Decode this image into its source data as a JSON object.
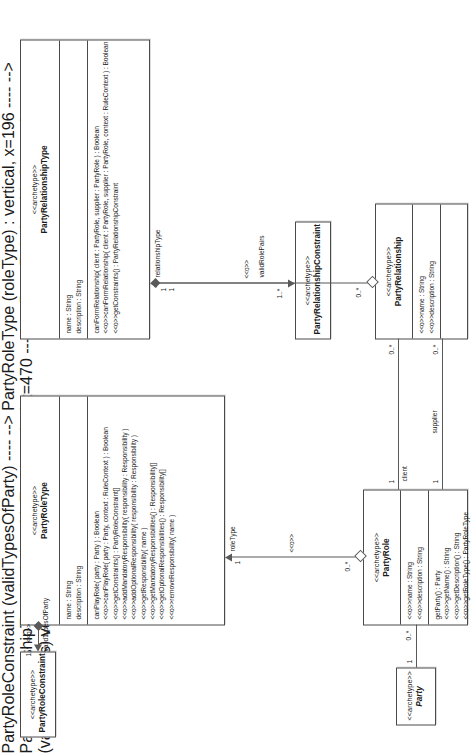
{
  "diagram": {
    "stereotype": "<<archetype>>",
    "op_stereotype": "<<o>>",
    "assoc_stereotype": "<<o>>"
  },
  "classes": {
    "party": {
      "stereotype": "<<archetype>>",
      "name": "Party",
      "attributes": [],
      "operations": []
    },
    "party_role": {
      "stereotype": "<<archetype>>",
      "name": "PartyRole",
      "attributes": [
        "<<o>>name : String",
        "<<o>>description : String"
      ],
      "operations": [
        "getParty() : Party",
        "<<o>>getName() : String",
        "<<o>>getDescription() : String",
        "<<o>>getRoleType() : PartyRoleType"
      ]
    },
    "party_role_type": {
      "stereotype": "<<archetype>>",
      "name": "PartyRoleType",
      "attributes": [
        "name : String",
        "description : String"
      ],
      "operations": [
        "canPlayRole( party : Party ) : Boolean",
        "<<o>>canPlayRole( party : Party, context : RuleContext ) : Boolean",
        "<<o>>getConstraints() : PartyRoleConstraint[]",
        "<<o>>addMandatoryResponsibility( responsibility : Responsibility )",
        "<<o>>addOptionalResponsibility( responsibility : Responsibility )",
        "<<o>>getResponsibility( name )",
        "<<o>>getMandatoryResponsibilities() : Responsibility[]",
        "<<o>>getOptionalResponsibilities() : Responsibility[]",
        "<<o>>removeResponsibility( name )"
      ]
    },
    "party_role_constraint": {
      "stereotype": "<<archetype>>",
      "name": "PartyRoleConstraint",
      "attributes": [],
      "operations": []
    },
    "party_relationship": {
      "stereotype": "<<archetype>>",
      "name": "PartyRelationship",
      "attributes": [
        "<<o>>name : String",
        "<<o>>description : String"
      ],
      "operations": []
    },
    "party_relationship_type": {
      "stereotype": "<<archetype>>",
      "name": "PartyRelationshipType",
      "attributes": [
        "name : String",
        "description : String"
      ],
      "operations": [
        "canFormRelationship( client : PartyRole, supplier : PartyRole ) : Boolean",
        "<<o>>canFormRelationship( client : PartyRole, supplier : PartyRole, context : RuleContext ) : Boolean",
        "<<o>>getConstraints() : PartyRelationshipConstraint"
      ]
    },
    "party_relationship_constraint": {
      "stereotype": "<<archetype>>",
      "name": "PartyRelationshipConstraint",
      "attributes": [],
      "operations": []
    }
  },
  "associations": [
    {
      "id": "party-partyrole",
      "source_multiplicity": "1",
      "target_multiplicity": "0..*",
      "role_name": "",
      "stereotype": ""
    },
    {
      "id": "partyrole-partyroletype",
      "source_multiplicity": "0..*",
      "target_multiplicity": "1",
      "role_name": "roleType",
      "stereotype": "<<o>>"
    },
    {
      "id": "partyroletype-partyroleconstraint",
      "source_multiplicity": "1",
      "target_multiplicity": "1..*",
      "role_name": "validTypesOfParty",
      "stereotype": "<<o>>"
    },
    {
      "id": "partyrole-partyrelationship-client",
      "source_multiplicity": "1",
      "target_multiplicity": "0..*",
      "role_name": "client",
      "stereotype": ""
    },
    {
      "id": "partyrole-partyrelationship-supplier",
      "source_multiplicity": "1",
      "target_multiplicity": "0..*",
      "role_name": "supplier",
      "stereotype": ""
    },
    {
      "id": "partyrelationship-partyrelationshiptype",
      "source_multiplicity": "0..*",
      "target_multiplicity": "1",
      "role_name": "relationshipType",
      "stereotype": "<<o>>"
    },
    {
      "id": "partyrelationshiptype-constraint",
      "source_multiplicity": "1",
      "target_multiplicity": "1..*",
      "role_name": "validRolePairs",
      "stereotype": "<<o>>"
    }
  ]
}
